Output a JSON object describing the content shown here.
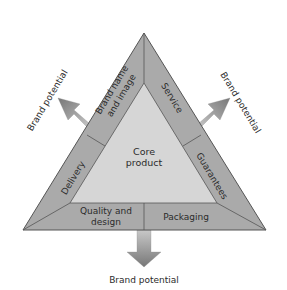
{
  "diagram": {
    "center": {
      "line1": "Core",
      "line2": "product"
    },
    "segments": {
      "brand_name": {
        "line1": "Brand name",
        "line2": "and image"
      },
      "service": "Service",
      "delivery": "Delivery",
      "guarantees": "Guarantees",
      "quality": {
        "line1": "Quality and",
        "line2": "design"
      },
      "packaging": "Packaging"
    },
    "arrows": {
      "left": "Brand potential",
      "right": "Brand potential",
      "bottom": "Brand potential"
    },
    "colors": {
      "outer_band": "#aaaaaa",
      "inner_core": "#d6d6d6",
      "stroke": "#555555",
      "arrow_light": "#c4c4c4",
      "arrow_dark": "#7d7d7d",
      "text": "#2b2b2b"
    }
  }
}
